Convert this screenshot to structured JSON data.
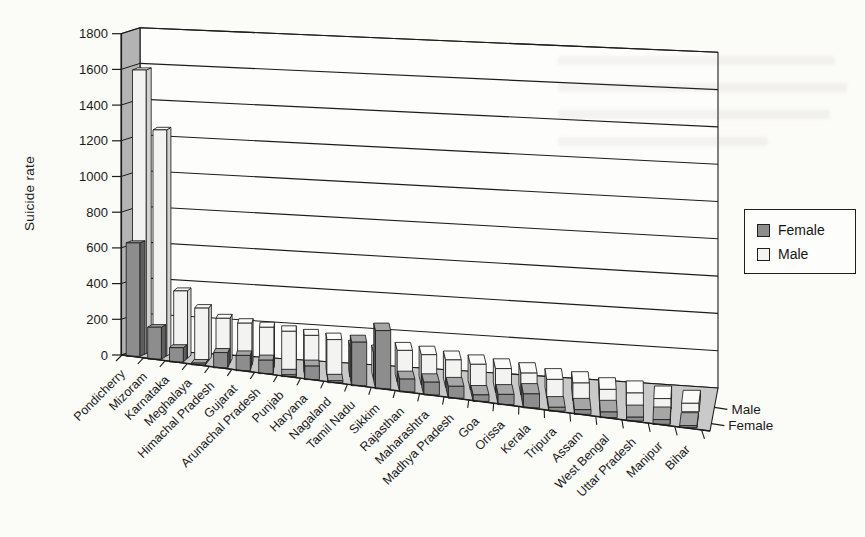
{
  "figure": {
    "background_color": "#fbfbf8",
    "kind": "scanned 3D bar chart"
  },
  "chart_data": {
    "type": "bar",
    "projection": "3d-perspective-columns",
    "title": "",
    "xlabel": "",
    "ylabel": "Suicide rate",
    "ylim": [
      0,
      1800
    ],
    "ytick_step": 200,
    "yticks": [
      "0",
      "200",
      "400",
      "600",
      "800",
      "1000",
      "1200",
      "1400",
      "1600",
      "1800"
    ],
    "grid": "horizontal-back-wall",
    "categories": [
      "Pondicherry",
      "Mizoram",
      "Karnataka",
      "Meghalaya",
      "Himachal Pradesh",
      "Gujarat",
      "Arunachal Pradesh",
      "Punjab",
      "Haryana",
      "Nagaland",
      "Tamil Nadu",
      "Sikkim",
      "Rajasthan",
      "Maharashtra",
      "Madhya Pradesh",
      "Goa",
      "Orissa",
      "Kerala",
      "Tripura",
      "Assam",
      "West Bengal",
      "Uttar Pradesh",
      "Manipur",
      "Bihar"
    ],
    "series": [
      {
        "name": "Female",
        "values": [
          640,
          180,
          80,
          10,
          85,
          85,
          75,
          10,
          75,
          10,
          240,
          320,
          70,
          70,
          65,
          35,
          55,
          75,
          20,
          25,
          30,
          20,
          25,
          10
        ],
        "front_color": "#8d8d8d",
        "side_color": "#5e5e5e",
        "top_color": "#a6a6a6"
      },
      {
        "name": "Male",
        "values": [
          1610,
          1280,
          380,
          295,
          250,
          235,
          225,
          215,
          205,
          195,
          165,
          150,
          175,
          165,
          150,
          140,
          130,
          120,
          100,
          95,
          75,
          70,
          55,
          45
        ],
        "front_color": "#f3f3f1",
        "side_color": "#d2d2d0",
        "top_color": "#fbfbfa"
      }
    ],
    "series_depth_axis_labels": [
      "Male",
      "Female"
    ],
    "legend": {
      "position": "right",
      "entries": [
        "Female",
        "Male"
      ]
    },
    "colors": {
      "back_wall": "#fdfdfc",
      "side_wall": "#b3b3b3",
      "floor": "#c9c9c9",
      "line": "#1c1c1c",
      "label_text": "#1a1a1a"
    }
  }
}
